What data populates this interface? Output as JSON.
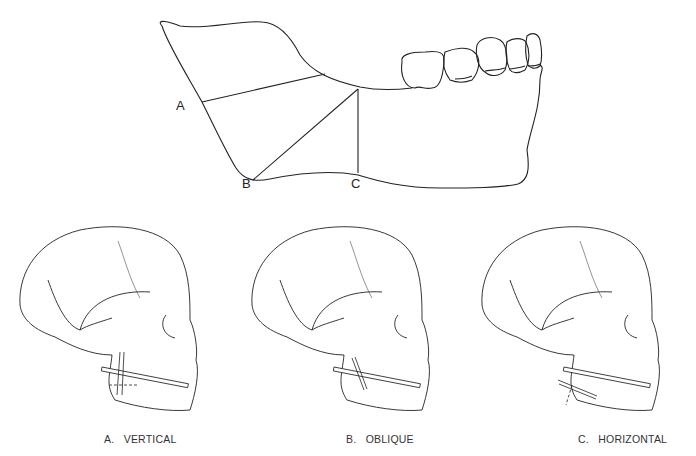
{
  "mandible": {
    "points": [
      {
        "key": "A",
        "label": "A",
        "x": 176,
        "y": 104
      },
      {
        "key": "B",
        "label": "B",
        "x": 241,
        "y": 178
      },
      {
        "key": "C",
        "label": "C",
        "x": 350,
        "y": 178
      }
    ]
  },
  "panels": [
    {
      "letter": "A.",
      "name": "VERTICAL",
      "caption": "A.   VERTICAL"
    },
    {
      "letter": "B.",
      "name": "OBLIQUE",
      "caption": "B.   OBLIQUE"
    },
    {
      "letter": "C.",
      "name": "HORIZONTAL",
      "caption": "C.   HORIZONTAL"
    }
  ],
  "colors": {
    "line": "#222222",
    "suture": "#777777",
    "background": "#ffffff"
  }
}
